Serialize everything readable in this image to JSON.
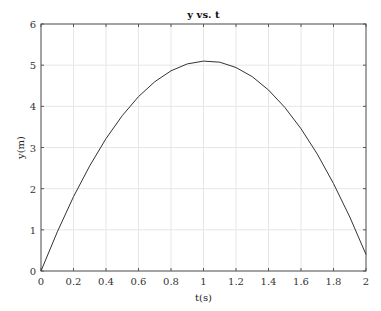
{
  "chart_data": {
    "type": "line",
    "title": "y vs. t",
    "xlabel": "t(s)",
    "ylabel": "y(m)",
    "xlim": [
      0,
      2
    ],
    "ylim": [
      0,
      6
    ],
    "xticks": [
      "0",
      "0.2",
      "0.4",
      "0.6",
      "0.8",
      "1",
      "1.2",
      "1.4",
      "1.6",
      "1.8",
      "2"
    ],
    "yticks": [
      "0",
      "1",
      "2",
      "3",
      "4",
      "5",
      "6"
    ],
    "grid": true,
    "legend": null,
    "series": [
      {
        "name": "y",
        "color": "#333333",
        "x": [
          0,
          0.1,
          0.2,
          0.3,
          0.4,
          0.5,
          0.6,
          0.7,
          0.8,
          0.9,
          1.0,
          1.1,
          1.2,
          1.3,
          1.4,
          1.5,
          1.6,
          1.7,
          1.8,
          1.9,
          2.0
        ],
        "values": [
          0,
          0.951,
          1.804,
          2.559,
          3.216,
          3.775,
          4.236,
          4.599,
          4.864,
          5.031,
          5.1,
          5.071,
          4.944,
          4.719,
          4.396,
          3.975,
          3.456,
          2.839,
          2.124,
          1.311,
          0.4
        ]
      }
    ]
  }
}
